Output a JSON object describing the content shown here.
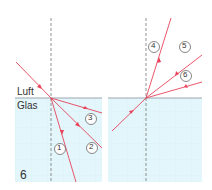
{
  "figure": {
    "number_label": "6",
    "medium_top": "Luft",
    "medium_bottom": "Glas",
    "colors": {
      "ray": "#e8435a",
      "glass": "#e3f6fb",
      "interface": "#9aa6ad",
      "normal": "#777777",
      "grid": "#cdebf2"
    },
    "left_panel": {
      "rays": [
        {
          "id": "incident",
          "label": ""
        },
        {
          "id": "1",
          "label": "1"
        },
        {
          "id": "2",
          "label": "2"
        },
        {
          "id": "3",
          "label": "3"
        }
      ]
    },
    "right_panel": {
      "rays": [
        {
          "id": "incident",
          "label": ""
        },
        {
          "id": "4",
          "label": "4"
        },
        {
          "id": "5",
          "label": "5"
        },
        {
          "id": "6",
          "label": "6"
        }
      ]
    }
  }
}
